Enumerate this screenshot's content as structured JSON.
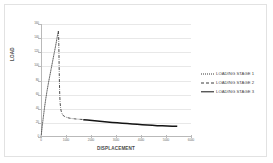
{
  "chart_data": {
    "type": "line",
    "title": "",
    "xlabel": "DISPLACEMENT",
    "ylabel": "LOAD",
    "xlim": [
      0,
      6000
    ],
    "ylim": [
      0,
      160
    ],
    "xticks": [
      "0",
      "1000",
      "2000",
      "3000",
      "4000",
      "5000",
      "6000"
    ],
    "yticks": [
      "0",
      "20",
      "40",
      "60",
      "80",
      "100",
      "120",
      "140",
      "160"
    ],
    "grid": true,
    "legend_position": "right",
    "series": [
      {
        "name": "LOADING STAGE 1",
        "style": "dotted",
        "color": "#3a3a3a",
        "points": [
          [
            0,
            0
          ],
          [
            20,
            6
          ],
          [
            45,
            14
          ],
          [
            75,
            23
          ],
          [
            110,
            33
          ],
          [
            150,
            44
          ],
          [
            195,
            55
          ],
          [
            245,
            66
          ],
          [
            300,
            77
          ],
          [
            360,
            88
          ],
          [
            420,
            99
          ],
          [
            480,
            110
          ],
          [
            540,
            121
          ],
          [
            590,
            130
          ],
          [
            635,
            139
          ],
          [
            670,
            146
          ],
          [
            695,
            150
          ]
        ]
      },
      {
        "name": "LOADING STAGE 2",
        "style": "dash-dot",
        "color": "#3a3a3a",
        "points": [
          [
            695,
            150
          ],
          [
            705,
            143
          ],
          [
            712,
            131
          ],
          [
            718,
            118
          ],
          [
            724,
            104
          ],
          [
            730,
            90
          ],
          [
            737,
            77
          ],
          [
            745,
            65
          ],
          [
            755,
            55
          ],
          [
            768,
            47
          ],
          [
            785,
            41
          ],
          [
            805,
            37
          ],
          [
            830,
            34
          ],
          [
            860,
            32
          ],
          [
            900,
            30
          ],
          [
            950,
            29
          ],
          [
            1010,
            28
          ],
          [
            1080,
            27.2
          ],
          [
            1160,
            26.6
          ],
          [
            1250,
            26.1
          ],
          [
            1350,
            25.7
          ],
          [
            1460,
            25.3
          ],
          [
            1570,
            25.0
          ],
          [
            1680,
            24.8
          ]
        ]
      },
      {
        "name": "LOADING STAGE 3",
        "style": "solid",
        "color": "#141414",
        "points": [
          [
            1690,
            24.6
          ],
          [
            1850,
            24.0
          ],
          [
            2050,
            23.3
          ],
          [
            2250,
            22.6
          ],
          [
            2450,
            22.0
          ],
          [
            2650,
            21.3
          ],
          [
            2850,
            20.7
          ],
          [
            3050,
            20.1
          ],
          [
            3250,
            19.5
          ],
          [
            3450,
            19.0
          ],
          [
            3650,
            18.4
          ],
          [
            3850,
            17.9
          ],
          [
            4050,
            17.4
          ],
          [
            4250,
            16.9
          ],
          [
            4450,
            16.5
          ],
          [
            4650,
            16.1
          ],
          [
            4850,
            15.8
          ],
          [
            5050,
            15.5
          ],
          [
            5250,
            15.3
          ],
          [
            5450,
            15.1
          ]
        ]
      }
    ]
  },
  "legend": {
    "items": [
      {
        "label": "LOADING STAGE 1"
      },
      {
        "label": "LOADING STAGE 2"
      },
      {
        "label": "LOADING STAGE 3"
      }
    ]
  }
}
